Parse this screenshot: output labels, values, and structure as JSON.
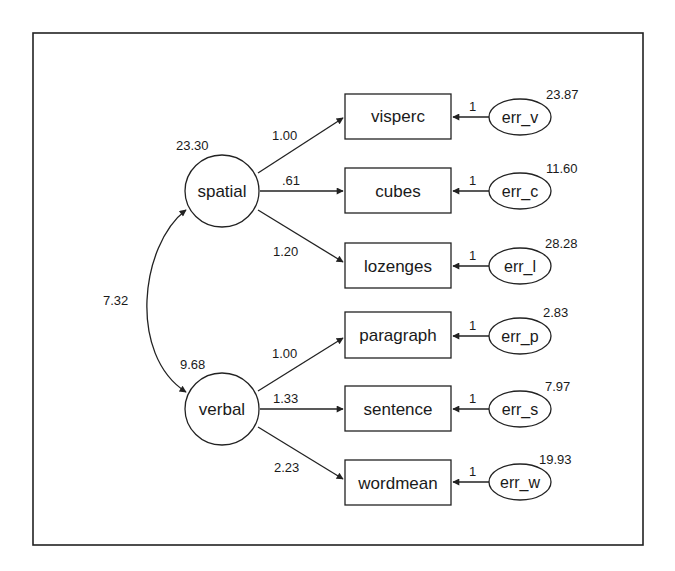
{
  "diagram": {
    "type": "structural-equation-model",
    "latent_factors": [
      {
        "id": "spatial",
        "label": "spatial",
        "variance": "23.30"
      },
      {
        "id": "verbal",
        "label": "verbal",
        "variance": "9.68"
      }
    ],
    "covariance": {
      "between": [
        "spatial",
        "verbal"
      ],
      "value": "7.32"
    },
    "observed": [
      {
        "label": "visperc",
        "factor": "spatial",
        "loading": "1.00",
        "error": "err_v",
        "error_path": "1",
        "error_variance": "23.87"
      },
      {
        "label": "cubes",
        "factor": "spatial",
        "loading": ".61",
        "error": "err_c",
        "error_path": "1",
        "error_variance": "11.60"
      },
      {
        "label": "lozenges",
        "factor": "spatial",
        "loading": "1.20",
        "error": "err_l",
        "error_path": "1",
        "error_variance": "28.28"
      },
      {
        "label": "paragraph",
        "factor": "verbal",
        "loading": "1.00",
        "error": "err_p",
        "error_path": "1",
        "error_variance": "2.83"
      },
      {
        "label": "sentence",
        "factor": "verbal",
        "loading": "1.33",
        "error": "err_s",
        "error_path": "1",
        "error_variance": "7.97"
      },
      {
        "label": "wordmean",
        "factor": "verbal",
        "loading": "2.23",
        "error": "err_w",
        "error_path": "1",
        "error_variance": "19.93"
      }
    ]
  },
  "colors": {
    "stroke": "#222222",
    "background": "#ffffff",
    "text": "#1a1a1a"
  }
}
